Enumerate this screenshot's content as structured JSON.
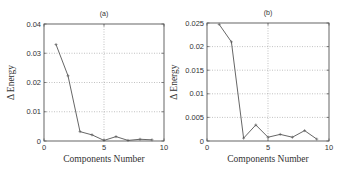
{
  "chart_data": [
    {
      "type": "line",
      "title": "(a)",
      "xlabel": "Components Number",
      "ylabel": "Δ Energy",
      "xlim": [
        0,
        10
      ],
      "ylim": [
        0,
        0.04
      ],
      "xticks": [
        0,
        5,
        10
      ],
      "xtick_labels": [
        "0",
        "5",
        "10"
      ],
      "yticks": [
        0,
        0.01,
        0.02,
        0.03,
        0.04
      ],
      "ytick_labels": [
        "0",
        "0.01",
        "0.02",
        "0.03",
        "0.04"
      ],
      "grid": true,
      "legend": null,
      "series": [
        {
          "name": "Δ Energy",
          "x": [
            1,
            2,
            3,
            4,
            5,
            6,
            7,
            8,
            9
          ],
          "values": [
            0.033,
            0.0223,
            0.0032,
            0.0021,
            0.0002,
            0.0015,
            0.0002,
            0.0006,
            0.0004
          ]
        }
      ]
    },
    {
      "type": "line",
      "title": "(b)",
      "xlabel": "Components Number",
      "ylabel": "Δ Energy",
      "xlim": [
        0,
        10
      ],
      "ylim": [
        0,
        0.025
      ],
      "xticks": [
        0,
        5,
        10
      ],
      "xtick_labels": [
        "0",
        "5",
        "10"
      ],
      "yticks": [
        0,
        0.005,
        0.01,
        0.015,
        0.02,
        0.025
      ],
      "ytick_labels": [
        "0",
        "0.005",
        "0.01",
        "0.015",
        "0.02",
        "0.025"
      ],
      "grid": true,
      "legend": null,
      "series": [
        {
          "name": "Δ Energy",
          "x": [
            1,
            2,
            3,
            4,
            5,
            6,
            7,
            8,
            9
          ],
          "values": [
            0.0247,
            0.021,
            0.0006,
            0.0034,
            0.0008,
            0.0014,
            0.0008,
            0.0022,
            0.0004
          ]
        }
      ]
    }
  ],
  "layout": {
    "panels": [
      {
        "left": 44,
        "top": 24,
        "width": 120,
        "height": 117
      },
      {
        "left": 207,
        "top": 23,
        "width": 122,
        "height": 118
      }
    ],
    "colors": {
      "line": "#555555",
      "grid": "#999999",
      "frame": "#555555"
    }
  }
}
